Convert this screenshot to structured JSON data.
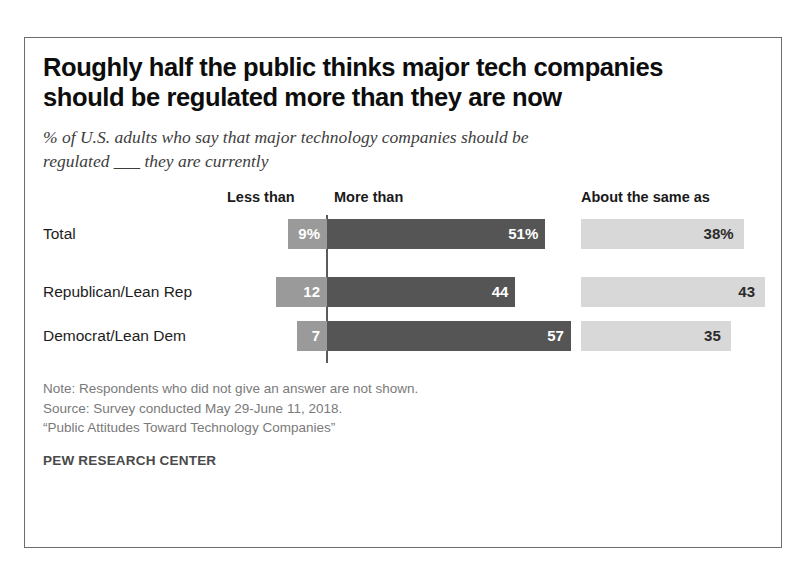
{
  "title": {
    "line1": "Roughly half the public thinks major tech companies",
    "line2": "should be regulated more than they are now"
  },
  "subtitle": {
    "line1": "% of U.S. adults who say that major technology companies should be",
    "line2": "regulated ___ they are currently"
  },
  "headers": {
    "less": "Less than",
    "more": "More than",
    "same": "About the same as"
  },
  "rows": [
    {
      "label": "Total",
      "less_label": "9%",
      "more_label": "51%",
      "same_label": "38%"
    },
    {
      "label": "Republican/Lean Rep",
      "less_label": "12",
      "more_label": "44",
      "same_label": "43"
    },
    {
      "label": "Democrat/Lean Dem",
      "less_label": "7",
      "more_label": "57",
      "same_label": "35"
    }
  ],
  "notes": {
    "line1": "Note: Respondents who did not give an answer are not shown.",
    "line2": "Source: Survey conducted May 29-June 11, 2018.",
    "line3": "“Public Attitudes Toward Technology Companies”"
  },
  "attribution": "PEW RESEARCH CENTER",
  "colors": {
    "less_than": "#9a9a9a",
    "more_than": "#555555",
    "about_same": "#d8d8d8",
    "border": "#6d6d6d",
    "title_text": "#0d0d0d",
    "note_text": "#7a7a7a"
  },
  "chart_data": {
    "type": "bar",
    "title": "Roughly half the public thinks major tech companies should be regulated more than they are now",
    "subtitle": "% of U.S. adults who say that major technology companies should be regulated ___ they are currently",
    "xlabel": "",
    "ylabel": "",
    "categories": [
      "Total",
      "Republican/Lean Rep",
      "Democrat/Lean Dem"
    ],
    "series": [
      {
        "name": "Less than",
        "values": [
          9,
          12,
          7
        ],
        "color": "#9a9a9a",
        "direction": "left"
      },
      {
        "name": "More than",
        "values": [
          51,
          44,
          57
        ],
        "color": "#555555",
        "direction": "right"
      },
      {
        "name": "About the same as",
        "values": [
          38,
          43,
          35
        ],
        "color": "#d8d8d8",
        "direction": "right",
        "panel": "separate"
      }
    ],
    "value_labels": [
      [
        "9%",
        "51%",
        "38%"
      ],
      [
        "12",
        "44",
        "43"
      ],
      [
        "7",
        "57",
        "35"
      ]
    ],
    "orientation": "horizontal",
    "diverging": true,
    "grid": false,
    "legend_position": "top",
    "units": "percent",
    "note": "Note: Respondents who did not give an answer are not shown.",
    "source": "Survey conducted May 29-June 11, 2018. “Public Attitudes Toward Technology Companies”",
    "attribution": "PEW RESEARCH CENTER"
  }
}
